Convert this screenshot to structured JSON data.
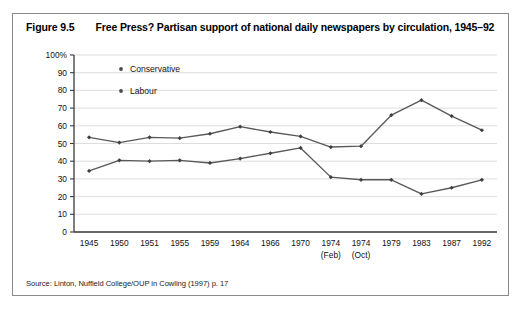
{
  "figure": {
    "number": "Figure 9.5",
    "title": "Free Press? Partisan support of national daily newspapers by circulation, 1945–92",
    "source": "Source: Linton, Nuffield College/OUP in Cowling (1997) p. 17"
  },
  "chart_data": {
    "type": "line",
    "title": "Free Press? Partisan support of national daily newspapers by circulation, 1945–92",
    "xlabel": "",
    "ylabel": "",
    "ylim": [
      0,
      100
    ],
    "yticks": [
      "0",
      "10",
      "20",
      "30",
      "40",
      "50",
      "60",
      "70",
      "80",
      "90",
      "100%"
    ],
    "ytick_values": [
      0,
      10,
      20,
      30,
      40,
      50,
      60,
      70,
      80,
      90,
      100
    ],
    "grid": true,
    "legend_position": "top-left-inside",
    "categories": [
      "1945",
      "1950",
      "1951",
      "1955",
      "1959",
      "1964",
      "1966",
      "1970",
      "1974",
      "1974",
      "1979",
      "1983",
      "1987",
      "1992"
    ],
    "category_sublabels": [
      "",
      "",
      "",
      "",
      "",
      "",
      "",
      "",
      "(Feb)",
      "(Oct)",
      "",
      "",
      "",
      ""
    ],
    "series": [
      {
        "name": "Conservative",
        "color": "#595959",
        "values": [
          53.5,
          50.5,
          53.5,
          53,
          55.5,
          59.5,
          56.5,
          54,
          48,
          48.5,
          66,
          74.5,
          65.5,
          57.5
        ]
      },
      {
        "name": "Labour",
        "color": "#595959",
        "values": [
          34.5,
          40.5,
          40,
          40.5,
          39,
          41.5,
          44.5,
          47.5,
          31,
          29.5,
          29.5,
          21.5,
          25,
          29.5
        ]
      }
    ]
  }
}
